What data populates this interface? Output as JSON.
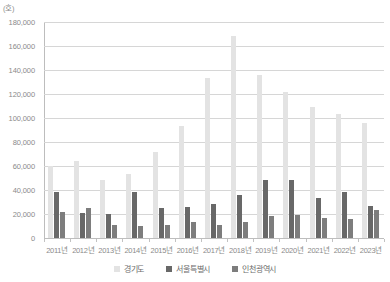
{
  "unit_label": "(호)",
  "chart_data": {
    "type": "bar",
    "title": "",
    "subtitle": "",
    "xlabel": "",
    "ylabel": "",
    "unit": "(호)",
    "grid": true,
    "legend_position": "bottom",
    "ylim": [
      0,
      180000
    ],
    "ytick_step": 20000,
    "ytick_labels": [
      "180,000",
      "160,000",
      "140,000",
      "120,000",
      "100,000",
      "80,000",
      "60,000",
      "40,000",
      "20,000",
      "0"
    ],
    "ytick_values": [
      180000,
      160000,
      140000,
      120000,
      100000,
      80000,
      60000,
      40000,
      20000,
      0
    ],
    "categories": [
      "2011년",
      "2012년",
      "2013년",
      "2014년",
      "2015년",
      "2016년",
      "2017년",
      "2018년",
      "2019년",
      "2020년",
      "2021년",
      "2022년",
      "2023년"
    ],
    "series": [
      {
        "name": "경기도",
        "color": "#e3e3e3",
        "values": [
          60000,
          64000,
          48000,
          53000,
          72000,
          93000,
          133000,
          168000,
          136000,
          122000,
          109000,
          103000,
          96000
        ]
      },
      {
        "name": "서울특별시",
        "color": "#686868",
        "values": [
          38000,
          21000,
          20000,
          38000,
          25000,
          26000,
          28000,
          36000,
          48000,
          48000,
          33000,
          38000,
          27000
        ]
      },
      {
        "name": "인천광역시",
        "color": "#7d7d7d",
        "values": [
          22000,
          25000,
          11000,
          10000,
          11000,
          13000,
          11000,
          13000,
          18000,
          19000,
          17000,
          16000,
          23000
        ]
      }
    ]
  }
}
